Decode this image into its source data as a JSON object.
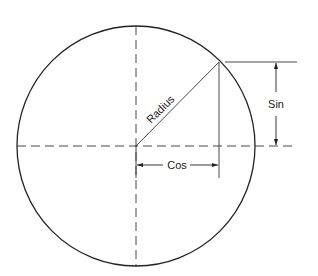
{
  "diagram": {
    "labels": {
      "radius": "Radius",
      "sin": "Sin",
      "cos": "Cos"
    },
    "colors": {
      "stroke": "#222222",
      "background": "#ffffff"
    }
  }
}
